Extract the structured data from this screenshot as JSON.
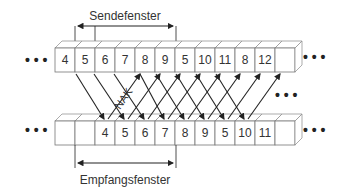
{
  "diagram": {
    "title_sender": "Sendefenster",
    "title_receiver": "Empfangsfenster",
    "nak_label": "NAK",
    "ellipsis": "• • •",
    "top_row": [
      "4",
      "5",
      "6",
      "7",
      "8",
      "9",
      "5",
      "10",
      "11",
      "8",
      "12",
      ""
    ],
    "bottom_row": [
      "",
      "",
      "4",
      "5",
      "6",
      "7",
      "8",
      "9",
      "5",
      "10",
      "11",
      ""
    ],
    "colors": {
      "line": "#222222",
      "box_stroke": "#777777",
      "text": "#333333"
    }
  }
}
